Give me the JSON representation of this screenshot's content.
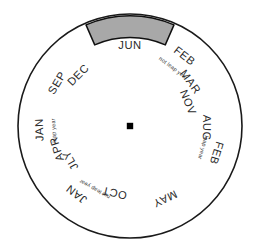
{
  "figure": {
    "name": "month-wheel",
    "type": "circular-sector-diagram",
    "sector_count": 7,
    "center": {
      "x": 130,
      "y": 126
    },
    "radius": 112,
    "colors": {
      "background": "#ffffff",
      "rim_stroke": "#1a1a1a",
      "spoke_stroke": "#4a4a4a",
      "highlight_fill": "#a8a8a8",
      "highlight_stroke": "#101010",
      "hub_fill": "#000000",
      "text": "#2b2b2b"
    }
  },
  "hub": {
    "label": "center-hub"
  },
  "highlight": {
    "name": "jun-highlight-band",
    "sector_index": 0,
    "sector_label": "JUN",
    "inner_radius_ratio": 0.79,
    "outer_radius_ratio": 0.985
  },
  "sectors": [
    {
      "id": "sector-jun",
      "index": 0,
      "mid_angle_deg": -90,
      "start_angle_deg": -115.7,
      "end_angle_deg": -64.3,
      "highlighted": true,
      "labels": [
        {
          "text": "JUN",
          "radius": 80,
          "angle_offset_deg": 0,
          "size": "month",
          "rotation_deg": 0
        }
      ]
    },
    {
      "id": "sector-feb-notleap-mar-nov",
      "index": 1,
      "mid_angle_deg": -38.6,
      "start_angle_deg": -64.3,
      "end_angle_deg": -12.9,
      "highlighted": false,
      "labels": [
        {
          "text": "FEB",
          "radius": 88,
          "angle_offset_deg": -13.5,
          "size": "month",
          "rotation_deg": 0
        },
        {
          "text": "not leap year",
          "radius": 72,
          "angle_offset_deg": -14.5,
          "size": "note",
          "rotation_deg": 0
        },
        {
          "text": "MAR",
          "radius": 74,
          "angle_offset_deg": 2.5,
          "size": "month",
          "rotation_deg": 0
        },
        {
          "text": "NOV",
          "radius": 62,
          "angle_offset_deg": 16.5,
          "size": "month",
          "rotation_deg": 0
        }
      ]
    },
    {
      "id": "sector-feb-leap-aug",
      "index": 2,
      "mid_angle_deg": 12.9,
      "start_angle_deg": -12.9,
      "end_angle_deg": 38.6,
      "highlighted": false,
      "labels": [
        {
          "text": "FEB",
          "radius": 90,
          "angle_offset_deg": 4.5,
          "size": "month",
          "rotation_deg": 0
        },
        {
          "text": "leap year",
          "radius": 76,
          "angle_offset_deg": 3.5,
          "size": "note",
          "rotation_deg": 0
        },
        {
          "text": "AUG",
          "radius": 76,
          "angle_offset_deg": -11.5,
          "size": "month",
          "rotation_deg": 0
        }
      ]
    },
    {
      "id": "sector-may",
      "index": 3,
      "mid_angle_deg": 64.3,
      "start_angle_deg": 38.6,
      "end_angle_deg": 90,
      "highlighted": false,
      "labels": [
        {
          "text": "MAY",
          "radius": 80,
          "angle_offset_deg": 0,
          "size": "month",
          "rotation_deg": 0
        }
      ]
    },
    {
      "id": "sector-oct-jan-notleap",
      "index": 4,
      "mid_angle_deg": 115.7,
      "start_angle_deg": 90,
      "end_angle_deg": 141.4,
      "highlighted": false,
      "labels": [
        {
          "text": "OCT",
          "radius": 68,
          "angle_offset_deg": -12.5,
          "size": "month",
          "rotation_deg": 0
        },
        {
          "text": "not leap year",
          "radius": 72,
          "angle_offset_deg": 3.5,
          "size": "note",
          "rotation_deg": 0
        },
        {
          "text": "JAN",
          "radius": 86,
          "angle_offset_deg": 12.5,
          "size": "month",
          "rotation_deg": 0
        }
      ]
    },
    {
      "id": "sector-jan-leap-apr-jly",
      "index": 5,
      "mid_angle_deg": 167.1,
      "start_angle_deg": 141.4,
      "end_angle_deg": 192.9,
      "highlighted": false,
      "labels": [
        {
          "text": "JAN",
          "radius": 90,
          "angle_offset_deg": 10.5,
          "size": "month",
          "rotation_deg": 0
        },
        {
          "text": "leap year",
          "radius": 76,
          "angle_offset_deg": 9.5,
          "size": "note",
          "rotation_deg": 0
        },
        {
          "text": "APR",
          "radius": 76,
          "angle_offset_deg": -4.5,
          "size": "month",
          "rotation_deg": 0
        },
        {
          "text": "JLY",
          "radius": 68,
          "angle_offset_deg": -17.0,
          "size": "month",
          "rotation_deg": 0
        }
      ]
    },
    {
      "id": "sector-sep-dec",
      "index": 6,
      "mid_angle_deg": -141.4,
      "start_angle_deg": -167.1,
      "end_angle_deg": -115.7,
      "highlighted": false,
      "labels": [
        {
          "text": "SEP",
          "radius": 84,
          "angle_offset_deg": -8.0,
          "size": "month",
          "rotation_deg": 0
        },
        {
          "text": "DEC",
          "radius": 72,
          "angle_offset_deg": 6.0,
          "size": "month",
          "rotation_deg": 0
        }
      ]
    }
  ]
}
